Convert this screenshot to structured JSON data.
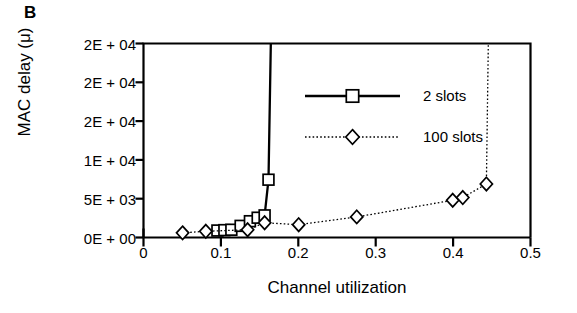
{
  "panel": {
    "label": "B"
  },
  "chart_data": {
    "type": "line",
    "title": "",
    "xlabel": "Channel utilization",
    "ylabel": "MAC delay (μ)",
    "xlim": [
      0,
      0.5
    ],
    "ylim": [
      0,
      25000
    ],
    "grid": false,
    "legend_position": "upper-center-right",
    "xticks": [
      0,
      0.1,
      0.2,
      0.3,
      0.4,
      0.5
    ],
    "xtick_labels": [
      "0",
      "0.1",
      "0.2",
      "0.3",
      "0.4",
      "0.5"
    ],
    "yticks": [
      0,
      5000,
      10000,
      15000,
      20000,
      25000
    ],
    "ytick_labels": [
      "0E + 00",
      "5E + 03",
      "1E + 04",
      "2E + 04",
      "2E + 04",
      "2E + 04"
    ],
    "series": [
      {
        "name": "2 slots",
        "marker": "square",
        "linestyle": "solid",
        "color": "#000000",
        "points": [
          {
            "x": 0.0955,
            "y": 900
          },
          {
            "x": 0.1045,
            "y": 950
          },
          {
            "x": 0.1135,
            "y": 1000
          },
          {
            "x": 0.1255,
            "y": 1500
          },
          {
            "x": 0.1375,
            "y": 2100
          },
          {
            "x": 0.1475,
            "y": 2550
          },
          {
            "x": 0.1565,
            "y": 2850
          },
          {
            "x": 0.1615,
            "y": 7450
          },
          {
            "x": 0.1645,
            "y": 25000
          }
        ]
      },
      {
        "name": "100 slots",
        "marker": "diamond",
        "linestyle": "dotted",
        "color": "#000000",
        "points": [
          {
            "x": 0.0505,
            "y": 600
          },
          {
            "x": 0.0805,
            "y": 800
          },
          {
            "x": 0.1345,
            "y": 1000
          },
          {
            "x": 0.1565,
            "y": 1900
          },
          {
            "x": 0.2005,
            "y": 1650
          },
          {
            "x": 0.2755,
            "y": 2650
          },
          {
            "x": 0.3995,
            "y": 4800
          },
          {
            "x": 0.4125,
            "y": 5150
          },
          {
            "x": 0.443,
            "y": 6900
          },
          {
            "x": 0.4455,
            "y": 25000
          }
        ]
      }
    ],
    "legend": [
      {
        "label": "2 slots",
        "marker": "square",
        "linestyle": "solid"
      },
      {
        "label": "100 slots",
        "marker": "diamond",
        "linestyle": "dotted"
      }
    ]
  }
}
